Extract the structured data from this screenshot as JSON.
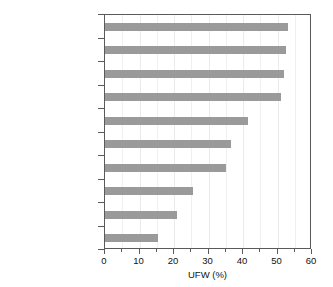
{
  "chart_data": {
    "type": "bar",
    "orientation": "horizontal",
    "title": "",
    "xlabel": "UFW (%)",
    "ylabel": "",
    "xlim": [
      0,
      60
    ],
    "xticks": [
      0,
      10,
      20,
      30,
      40,
      50,
      60
    ],
    "xminorticks": [
      5,
      15,
      25,
      35,
      45,
      55
    ],
    "grid": true,
    "legend": false,
    "bar_color": "#9a9a9a",
    "categories": [
      "Amman",
      "Algiers",
      "Sana'a",
      "Hebron",
      "Lebanon (average)",
      "Tehran",
      "Casablanca",
      "Ramallah",
      "Tunis",
      "Dubai"
    ],
    "values": [
      53,
      52.5,
      52,
      51,
      41.5,
      36.5,
      35,
      25.5,
      21,
      15.5
    ]
  }
}
